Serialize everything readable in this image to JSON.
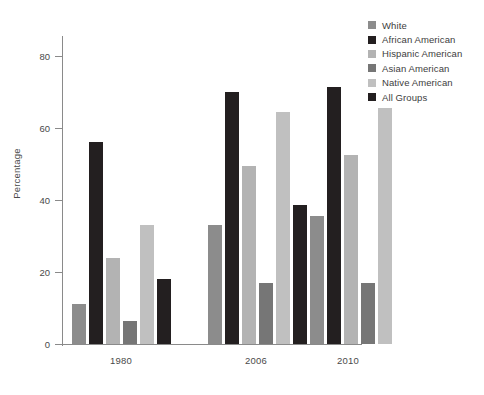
{
  "chart_data": {
    "type": "bar",
    "title": "",
    "xlabel": "",
    "ylabel": "Percentage",
    "categories": [
      "1980",
      "2006",
      "2010"
    ],
    "ylim": [
      0,
      85
    ],
    "yticks": [
      0,
      20,
      40,
      60,
      80
    ],
    "ytick_labels": [
      "0",
      "20",
      "40",
      "60",
      "80"
    ],
    "grid": false,
    "legend_position": "right",
    "series": [
      {
        "name": "White",
        "color": "#8c8c8c",
        "values": [
          11,
          33,
          35.5
        ]
      },
      {
        "name": "African American",
        "color": "#231f20",
        "values": [
          56,
          70,
          71.5
        ]
      },
      {
        "name": "Hispanic American",
        "color": "#b3b3b3",
        "values": [
          24,
          49.5,
          52.5
        ]
      },
      {
        "name": "Asian American",
        "color": "#767676",
        "values": [
          6.5,
          17,
          17
        ]
      },
      {
        "name": "Native American",
        "color": "#c0c0c0",
        "values": [
          33,
          64.5,
          65.5
        ]
      },
      {
        "name": "All Groups",
        "color": "#231f20",
        "values": [
          18,
          38.5,
          null
        ]
      }
    ]
  },
  "legend": {
    "items": [
      {
        "label": "White",
        "swatch": "#8c8c8c"
      },
      {
        "label": "African American",
        "swatch": "#231f20"
      },
      {
        "label": "Hispanic American",
        "swatch": "#b3b3b3"
      },
      {
        "label": "Asian American",
        "swatch": "#767676"
      },
      {
        "label": "Native American",
        "swatch": "#c0c0c0"
      },
      {
        "label": "All Groups",
        "swatch": "#231f20"
      }
    ]
  },
  "axes": {
    "y_title": "Percentage",
    "y_tick_labels": [
      "80",
      "60",
      "40",
      "20",
      "0"
    ],
    "x_tick_labels": [
      "1980",
      "2006",
      "2010"
    ]
  },
  "colors": {
    "axis": "#8a8a8a",
    "text": "#4a4a4a",
    "background": "#ffffff"
  }
}
